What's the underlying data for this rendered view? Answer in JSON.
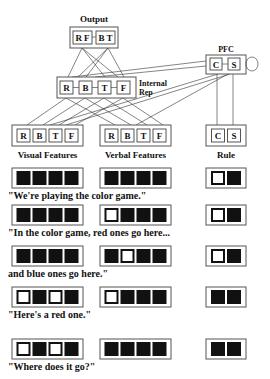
{
  "diagram": {
    "output": {
      "title": "Output",
      "units": [
        "R F",
        "B T"
      ],
      "box": [
        70,
        27,
        48,
        21
      ]
    },
    "pfc": {
      "title": "PFC",
      "units": [
        "C",
        "S"
      ],
      "box": [
        206,
        55,
        40,
        19
      ]
    },
    "internal_rep": {
      "title_line1": "Internal",
      "title_line2": "Rep",
      "units": [
        "R",
        "B",
        "T",
        "F"
      ],
      "box": [
        57,
        77,
        79,
        21
      ]
    },
    "inputs": [
      {
        "label": "Visual Features",
        "units": [
          "R",
          "B",
          "T",
          "F"
        ],
        "box": [
          12,
          125,
          71,
          21
        ]
      },
      {
        "label": "Verbal Features",
        "units": [
          "R",
          "B",
          "T",
          "F"
        ],
        "box": [
          100,
          125,
          71,
          21
        ]
      },
      {
        "label": "Rule",
        "units": [
          "C",
          "S"
        ],
        "box": [
          206,
          125,
          40,
          21
        ]
      }
    ],
    "colors": {
      "stroke": "#555555",
      "active": "#111111",
      "background": "#ffffff"
    }
  },
  "sequence": [
    {
      "caption": "\"We're playing the color game.\"",
      "visual": [
        1,
        1,
        1,
        1
      ],
      "verbal": [
        1,
        1,
        1,
        1
      ],
      "rule": [
        0,
        1
      ],
      "y": 168
    },
    {
      "caption": "\"In the color game, red ones go here...",
      "visual": [
        1,
        1,
        1,
        1
      ],
      "verbal": [
        0,
        1,
        1,
        1
      ],
      "rule": [
        0,
        1
      ],
      "y": 205
    },
    {
      "caption": "and blue ones go here.\"",
      "visual": [
        1,
        1,
        1,
        1
      ],
      "verbal": [
        1,
        0,
        1,
        1
      ],
      "rule": [
        0,
        1
      ],
      "y": 246
    },
    {
      "caption": "\"Here's a red one.\"",
      "visual": [
        0,
        1,
        0,
        1
      ],
      "verbal": [
        0,
        1,
        1,
        1
      ],
      "rule": [
        1,
        1
      ],
      "y": 287
    },
    {
      "caption": "\"Where does it go?\"",
      "visual": [
        0,
        1,
        0,
        1
      ],
      "verbal": [
        1,
        1,
        1,
        1
      ],
      "rule": [
        1,
        1
      ],
      "y": 339
    }
  ]
}
